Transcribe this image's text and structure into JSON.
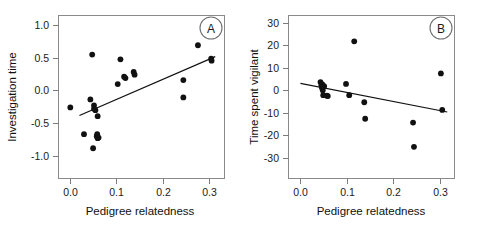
{
  "figure": {
    "background": "#ffffff",
    "point_color": "#111111",
    "line_color": "#111111",
    "axis_color": "#7d7d7d",
    "width": 487,
    "height": 231
  },
  "chart_data": [
    {
      "type": "scatter",
      "panel_label": "A",
      "title": "",
      "xlabel": "Pedigree relatedness",
      "ylabel": "Investigation time",
      "xlim": [
        -0.02,
        0.335
      ],
      "ylim": [
        -1.22,
        1.18
      ],
      "xticks": [
        0.0,
        0.1,
        0.2,
        0.3
      ],
      "xticklabels": [
        "0.0",
        "0.1",
        "0.2",
        "0.3"
      ],
      "yticks": [
        -1.0,
        -0.5,
        0.0,
        0.5,
        1.0
      ],
      "yticklabels": [
        "-1.0",
        "-0.5",
        "0.0",
        "0.5",
        "1.0"
      ],
      "grid": false,
      "legend": "none",
      "x": [
        0.0,
        0.03,
        0.044,
        0.048,
        0.05,
        0.052,
        0.052,
        0.055,
        0.058,
        0.059,
        0.06,
        0.06,
        0.062,
        0.104,
        0.11,
        0.118,
        0.121,
        0.139,
        0.141,
        0.248,
        0.248,
        0.28,
        0.309,
        0.31
      ],
      "y": [
        -0.18,
        -0.58,
        -0.06,
        0.61,
        -0.79,
        -0.15,
        -0.2,
        -0.22,
        -0.61,
        -0.58,
        -0.64,
        -0.31,
        -0.63,
        0.17,
        0.54,
        0.28,
        0.26,
        0.35,
        0.31,
        0.23,
        -0.03,
        0.75,
        0.55,
        0.52
      ],
      "fit_line": {
        "type": "linear",
        "x_start": 0.02,
        "y_start": -0.3,
        "x_end": 0.318,
        "y_end": 0.58
      }
    },
    {
      "type": "scatter",
      "panel_label": "B",
      "title": "",
      "xlabel": "Pedigree relatedness",
      "ylabel": "Time spent vigilant",
      "xlim": [
        -0.02,
        0.335
      ],
      "ylim": [
        -36,
        35
      ],
      "xticks": [
        0.0,
        0.1,
        0.2,
        0.3
      ],
      "xticklabels": [
        "0.0",
        "0.1",
        "0.2",
        "0.3"
      ],
      "yticks": [
        -30,
        -20,
        -10,
        0,
        10,
        20,
        30
      ],
      "yticklabels": [
        "-30",
        "-20",
        "-10",
        "0",
        "10",
        "20",
        "30"
      ],
      "grid": false,
      "legend": "none",
      "x": [
        0.044,
        0.046,
        0.047,
        0.048,
        0.049,
        0.05,
        0.052,
        0.058,
        0.06,
        0.1,
        0.107,
        0.118,
        0.14,
        0.142,
        0.247,
        0.249,
        0.308,
        0.311
      ],
      "y": [
        6.0,
        4.6,
        3.6,
        5.0,
        2.4,
        0.2,
        4.2,
        0.0,
        -0.2,
        5.2,
        0.2,
        24.0,
        -2.9,
        -10.2,
        -11.9,
        -22.6,
        9.8,
        -6.3
      ],
      "fit_line": {
        "type": "linear",
        "x_start": 0.0,
        "y_start": 5.4,
        "x_end": 0.322,
        "y_end": -7.2
      }
    }
  ]
}
